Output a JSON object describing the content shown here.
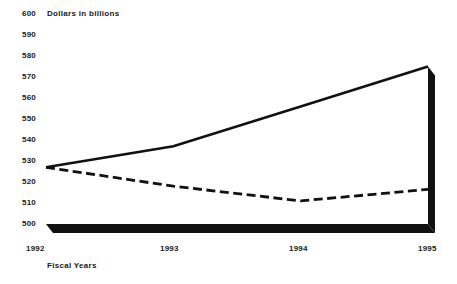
{
  "chart_data": {
    "type": "line",
    "title": "Dollars in billions",
    "xlabel": "Fiscal Years",
    "ylabel": "",
    "categories": [
      "1992",
      "1993",
      "1994",
      "1995"
    ],
    "x": [
      1992,
      1993,
      1994,
      1995
    ],
    "ylim": [
      500,
      600
    ],
    "xlim": [
      1992,
      1995
    ],
    "yticks": [
      500,
      510,
      520,
      530,
      540,
      550,
      560,
      570,
      580,
      590,
      600
    ],
    "ytick_labels": [
      "500",
      "510",
      "520",
      "530",
      "540",
      "550",
      "560",
      "570",
      "580",
      "590",
      "600"
    ],
    "xtick_labels": [
      "1992",
      "1993",
      "1994",
      "1995"
    ],
    "grid": false,
    "legend": "none",
    "style": "pseudo-3d-ribbon",
    "series": [
      {
        "name": "solid-line",
        "line_style": "solid",
        "color": "#111111",
        "values": [
          527,
          537,
          556,
          575
        ]
      },
      {
        "name": "dashed-line",
        "line_style": "dashed",
        "color": "#111111",
        "values": [
          527,
          518,
          511,
          516.5
        ]
      }
    ],
    "annotations": []
  },
  "chart": {
    "title": "Dollars in billions",
    "xaxis_title": "Fiscal Years",
    "ytick_labels": [
      "600",
      "590",
      "580",
      "570",
      "560",
      "550",
      "540",
      "530",
      "520",
      "510",
      "500"
    ],
    "xtick_labels": [
      "1992",
      "1993",
      "1994",
      "1995"
    ]
  },
  "colors": {
    "ink": "#111111",
    "text": "#1a1a1a",
    "background": "#ffffff",
    "slab": "#111111"
  }
}
